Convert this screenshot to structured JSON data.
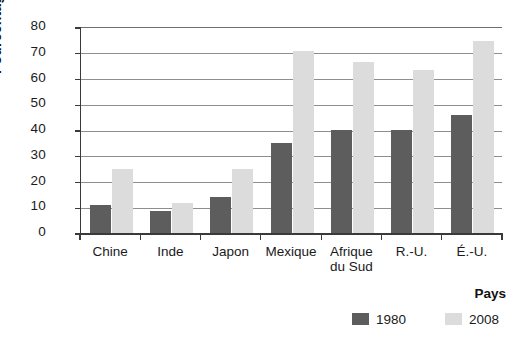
{
  "chart_data": {
    "type": "bar",
    "title": "",
    "subtitle": "",
    "xlabel": "Pays",
    "ylabel": "Pourcentage (%)",
    "categories": [
      "Chine",
      "Inde",
      "Japon",
      "Mexique",
      "Afrique\ndu Sud",
      "R.-U.",
      "É.-U."
    ],
    "series": [
      {
        "name": "1980",
        "color": "#5d5d5d",
        "values": [
          11,
          8.5,
          14,
          35,
          40,
          40,
          46
        ]
      },
      {
        "name": "2008",
        "color": "#dcdcdc",
        "values": [
          25,
          11.5,
          25,
          70.5,
          66.5,
          63.5,
          74.5
        ]
      }
    ],
    "ylim": [
      0,
      80
    ],
    "yticks": [
      0,
      10,
      20,
      30,
      40,
      50,
      60,
      70,
      80
    ],
    "ytick_labels": [
      "0",
      "10",
      "20",
      "30",
      "40",
      "50",
      "60",
      "70",
      "80"
    ],
    "grid": "horizontal",
    "legend_position": "bottom-right",
    "legend_title": "Pays",
    "legend_entries": [
      "1980",
      "2008"
    ]
  }
}
